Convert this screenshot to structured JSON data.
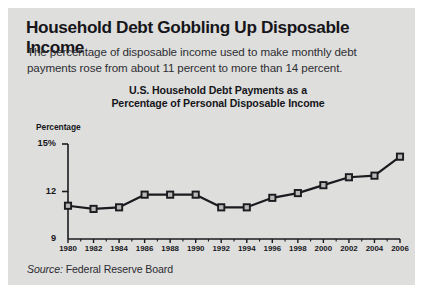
{
  "headline": "Household Debt Gobbling Up Disposable Income",
  "subtitle": "The percentage of disposable income used to make monthly debt payments rose from about 11 percent to more than 14 percent.",
  "source": {
    "label": "Source:",
    "value": "Federal Reserve Board"
  },
  "colors": {
    "panel_background": "#dededd",
    "page_background": "#ffffff",
    "text": "#16161a",
    "line": "#1b1b1f",
    "marker_fill": "#b9b9b8",
    "axis": "#1b1b1f"
  },
  "chart_data": {
    "type": "line",
    "title": "U.S. Household Debt Payments as a Percentage of Personal Disposable Income",
    "title_lines": [
      "U.S. Household Debt Payments as a",
      "Percentage of Personal Disposable Income"
    ],
    "xlabel": "",
    "ylabel": "Percentage",
    "ylim": [
      9,
      15
    ],
    "yticks": [
      9,
      12,
      15
    ],
    "ytick_labels": [
      "9",
      "12",
      "15%"
    ],
    "xlim": [
      1980,
      2006
    ],
    "xticks": [
      1980,
      1982,
      1984,
      1986,
      1988,
      1990,
      1992,
      1994,
      1996,
      1998,
      2000,
      2002,
      2004,
      2006
    ],
    "xtick_labels": [
      "1980",
      "1982",
      "1984",
      "1986",
      "1988",
      "1990",
      "1992",
      "1994",
      "1996",
      "1998",
      "2000",
      "2002",
      "2004",
      "2006"
    ],
    "minor_xticks": [
      1981,
      1983,
      1985,
      1987,
      1989,
      1991,
      1993,
      1995,
      1997,
      1999,
      2001,
      2003,
      2005
    ],
    "grid": false,
    "legend": false,
    "markers": "square",
    "x": [
      1980,
      1982,
      1984,
      1986,
      1988,
      1990,
      1992,
      1994,
      1996,
      1998,
      2000,
      2002,
      2004,
      2006
    ],
    "values": [
      11.1,
      10.9,
      11.0,
      11.8,
      11.8,
      11.8,
      11.0,
      11.0,
      11.6,
      11.9,
      12.4,
      12.9,
      13.0,
      14.2
    ]
  }
}
